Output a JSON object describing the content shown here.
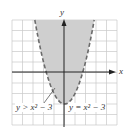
{
  "chart_data": {
    "type": "area",
    "title": "",
    "xlabel": "x",
    "ylabel": "y",
    "xlim": [
      -5,
      5
    ],
    "ylim": [
      -5,
      5
    ],
    "grid": true,
    "boundary": {
      "equation": "y = x^2 - 3",
      "style": "dashed",
      "color": "#6b6b6b"
    },
    "shaded_region": {
      "inequality": "y > x^2 - 3",
      "fill": "#cfcfcf"
    },
    "points": [
      {
        "x": -2.83,
        "y": 5
      },
      {
        "x": -2,
        "y": 1
      },
      {
        "x": -1.73,
        "y": 0
      },
      {
        "x": -1,
        "y": -2
      },
      {
        "x": 0,
        "y": -3
      },
      {
        "x": 1,
        "y": -2
      },
      {
        "x": 1.73,
        "y": 0
      },
      {
        "x": 2,
        "y": 1
      },
      {
        "x": 2.83,
        "y": 5
      }
    ],
    "annotations": [
      {
        "text": "y > x² − 3",
        "target": "shaded region"
      },
      {
        "text": "y = x² − 3",
        "target": "boundary curve"
      }
    ]
  },
  "labels": {
    "x_axis": "x",
    "y_axis": "y",
    "inequality": "y > x² − 3",
    "equation": "y = x² − 3"
  }
}
